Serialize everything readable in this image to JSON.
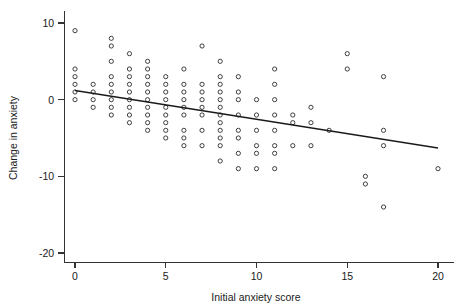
{
  "chart_data": {
    "type": "scatter",
    "title": "",
    "subtitle": "",
    "xlabel": "Initial anxiety score",
    "ylabel": "Change in anxiety",
    "xlim": [
      -0.6,
      20.9
    ],
    "ylim": [
      -21.2,
      11.6
    ],
    "xticks": [
      0,
      5,
      10,
      15,
      20
    ],
    "xticklabels": [
      "0",
      "5",
      "10",
      "15",
      "20"
    ],
    "yticks": [
      10,
      0,
      -10,
      -20
    ],
    "yticklabels": [
      "10",
      "0",
      "-10",
      "-20"
    ],
    "grid": false,
    "legend": null,
    "marker": "open-circle",
    "points": [
      [
        0,
        9
      ],
      [
        0,
        4
      ],
      [
        0,
        3
      ],
      [
        0,
        2
      ],
      [
        0,
        1
      ],
      [
        0,
        0
      ],
      [
        1,
        2
      ],
      [
        1,
        1
      ],
      [
        1,
        0
      ],
      [
        1,
        -1
      ],
      [
        2,
        8
      ],
      [
        2,
        7
      ],
      [
        2,
        5
      ],
      [
        2,
        3
      ],
      [
        2,
        2
      ],
      [
        2,
        1
      ],
      [
        2,
        0
      ],
      [
        2,
        -1
      ],
      [
        2,
        -2
      ],
      [
        3,
        6
      ],
      [
        3,
        4
      ],
      [
        3,
        3
      ],
      [
        3,
        2
      ],
      [
        3,
        1
      ],
      [
        3,
        0
      ],
      [
        3,
        -1
      ],
      [
        3,
        -2
      ],
      [
        3,
        -3
      ],
      [
        4,
        5
      ],
      [
        4,
        4
      ],
      [
        4,
        3
      ],
      [
        4,
        2
      ],
      [
        4,
        1
      ],
      [
        4,
        0
      ],
      [
        4,
        -1
      ],
      [
        4,
        -2
      ],
      [
        4,
        -3
      ],
      [
        4,
        -4
      ],
      [
        5,
        3
      ],
      [
        5,
        2
      ],
      [
        5,
        1
      ],
      [
        5,
        0
      ],
      [
        5,
        -1
      ],
      [
        5,
        -2
      ],
      [
        5,
        -3
      ],
      [
        5,
        -4
      ],
      [
        5,
        -5
      ],
      [
        6,
        4
      ],
      [
        6,
        2
      ],
      [
        6,
        1
      ],
      [
        6,
        0
      ],
      [
        6,
        -1
      ],
      [
        6,
        -2
      ],
      [
        6,
        -4
      ],
      [
        6,
        -5
      ],
      [
        6,
        -6
      ],
      [
        7,
        7
      ],
      [
        7,
        2
      ],
      [
        7,
        1
      ],
      [
        7,
        0
      ],
      [
        7,
        -1
      ],
      [
        7,
        -2
      ],
      [
        7,
        -4
      ],
      [
        7,
        -6
      ],
      [
        8,
        5
      ],
      [
        8,
        3
      ],
      [
        8,
        2
      ],
      [
        8,
        1
      ],
      [
        8,
        0
      ],
      [
        8,
        -1
      ],
      [
        8,
        -2
      ],
      [
        8,
        -3
      ],
      [
        8,
        -4
      ],
      [
        8,
        -5
      ],
      [
        8,
        -6
      ],
      [
        8,
        -8
      ],
      [
        9,
        3
      ],
      [
        9,
        1
      ],
      [
        9,
        0
      ],
      [
        9,
        -2
      ],
      [
        9,
        -4
      ],
      [
        9,
        -5
      ],
      [
        9,
        -7
      ],
      [
        9,
        -9
      ],
      [
        10,
        0
      ],
      [
        10,
        -2
      ],
      [
        10,
        -4
      ],
      [
        10,
        -6
      ],
      [
        10,
        -7
      ],
      [
        10,
        -9
      ],
      [
        11,
        4
      ],
      [
        11,
        2
      ],
      [
        11,
        0
      ],
      [
        11,
        -2
      ],
      [
        11,
        -4
      ],
      [
        11,
        -6
      ],
      [
        11,
        -7
      ],
      [
        11,
        -9
      ],
      [
        12,
        -2
      ],
      [
        12,
        -3
      ],
      [
        12,
        -6
      ],
      [
        13,
        -1
      ],
      [
        13,
        -3
      ],
      [
        13,
        -6
      ],
      [
        14,
        -4
      ],
      [
        15,
        6
      ],
      [
        15,
        4
      ],
      [
        16,
        -10
      ],
      [
        16,
        -11
      ],
      [
        17,
        3
      ],
      [
        17,
        -4
      ],
      [
        17,
        -6
      ],
      [
        17,
        -14
      ],
      [
        20,
        -9
      ]
    ],
    "fit_line": {
      "label": "least-squares fit",
      "x": [
        0,
        20
      ],
      "y": [
        1.2,
        -6.3
      ]
    }
  }
}
